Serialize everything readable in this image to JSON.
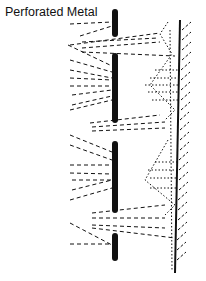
{
  "diagram": {
    "label": "Perforated Metal",
    "colors": {
      "ink": "#111111",
      "background": "#ffffff"
    },
    "elements": {
      "perforated_metal_segments": 4,
      "wall": "solid line with diagonal hatching on right side",
      "sound_paths": "dashed lines passing through perforations and reflecting",
      "resonance_zones": "dotted diamond-shaped regions near wall"
    }
  }
}
